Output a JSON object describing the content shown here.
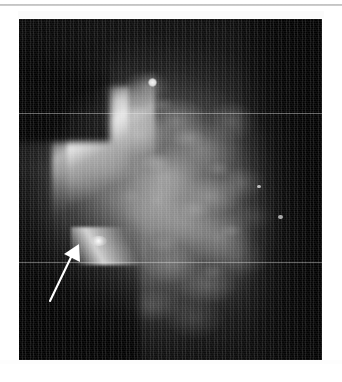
{
  "page": {
    "width": 342,
    "height": 382,
    "background_color": "#ffffff"
  },
  "divider": {
    "name": "top-horizontal-rule",
    "color": "#b9b9b9",
    "y": 4,
    "thickness": 2
  },
  "figure": {
    "modality": "mammogram",
    "title": "",
    "caption": "",
    "ghost_caption_text": "",
    "frame": {
      "x": 19,
      "y": 19,
      "width": 303,
      "height": 341
    },
    "background_color": "#050505",
    "tissue_color": "#a8a8a8",
    "annotation_color": "#ffffff",
    "regions": [
      {
        "name": "breast-tissue-mass",
        "label": "fibroglandular tissue"
      },
      {
        "name": "skin-line-ridge",
        "label": "anterior bright skin line"
      },
      {
        "name": "air-background",
        "label": "dark background"
      }
    ],
    "findings": [
      {
        "name": "spiculated-lesion",
        "label": "spiculated mass indicated by arrow",
        "x_pct": 26.0,
        "y_pct": 64.5
      },
      {
        "name": "calcification",
        "label": "punctate bright density",
        "x_pct": 44.1,
        "y_pct": 18.6
      }
    ],
    "arrow": {
      "name": "annotation-arrow",
      "color": "#ffffff",
      "tail_x_pct": 10.2,
      "tail_y_pct": 82.7,
      "tip_x_pct": 19.8,
      "tip_y_pct": 66.0,
      "stroke_width": 2.0,
      "head_length": 13
    },
    "artifacts": [
      {
        "name": "scan-band-upper",
        "y_pct": 27.6
      },
      {
        "name": "scan-band-lower",
        "y_pct": 71.2
      }
    ]
  }
}
